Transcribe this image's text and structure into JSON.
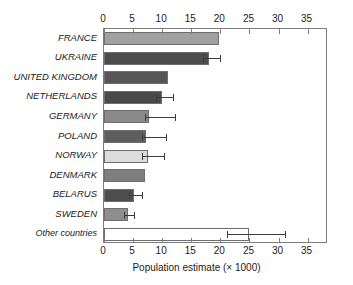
{
  "chart_data": {
    "type": "bar",
    "orientation": "horizontal",
    "title": "",
    "xlabel": "Population estimate (× 1000)",
    "ylabel": "",
    "xlim": [
      0,
      38.5
    ],
    "xticks": [
      0,
      5,
      10,
      15,
      20,
      25,
      30,
      35
    ],
    "xtick_labels": [
      "0",
      "5",
      "10",
      "15",
      "20",
      "25",
      "30",
      "35"
    ],
    "axis_top": true,
    "axis_bottom": true,
    "grid": false,
    "legend": null,
    "categories": [
      "FRANCE",
      "UKRAINE",
      "UNITED KINGDOM",
      "NETHERLANDS",
      "GERMANY",
      "POLAND",
      "NORWAY",
      "DENMARK",
      "BELARUS",
      "SWEDEN",
      "Other countries"
    ],
    "values": [
      19.8,
      18.0,
      11.0,
      10.0,
      7.7,
      7.3,
      7.5,
      7.0,
      5.1,
      4.1,
      25.0
    ],
    "errors_low": [
      null,
      17.0,
      null,
      9.0,
      7.0,
      6.6,
      6.5,
      null,
      4.3,
      3.4,
      21.2
    ],
    "errors_high": [
      null,
      19.9,
      null,
      11.8,
      12.2,
      10.6,
      10.3,
      null,
      6.5,
      5.2,
      31.1
    ],
    "bar_colors": [
      "#a0a0a0",
      "#4c4c4c",
      "#565656",
      "#4a4a4a",
      "#8a8a8a",
      "#5e5e5e",
      "#dcdcdc",
      "#7e7e7e",
      "#4e4e4e",
      "#8e8e8e",
      "#ffffff"
    ],
    "bar_edge_color": "#6e6e6e",
    "error_color": "#3c3c3c",
    "frame_color": "#7d7d7d",
    "text_color": "#1a1a1a"
  }
}
